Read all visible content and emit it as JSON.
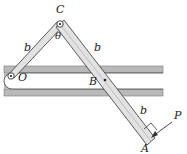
{
  "diagram": {
    "labels": {
      "C": "C",
      "O": "O",
      "B": "B",
      "A": "A",
      "P": "P",
      "theta": "θ",
      "b_left": "b",
      "b_right": "b",
      "b_lower": "b"
    },
    "colors": {
      "slot_fill": "#b9b9b9",
      "bar_fill": "#e2e2e2",
      "stroke": "#333333"
    }
  }
}
